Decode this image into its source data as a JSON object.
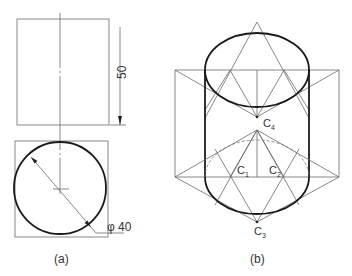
{
  "figures": [
    {
      "id": "a",
      "caption": "(a)",
      "dimensions": {
        "height_label": "50",
        "diameter_label": "φ 40"
      }
    },
    {
      "id": "b",
      "caption": "(b)",
      "points": {
        "c1": "C",
        "c1_sub": "1",
        "c2": "C",
        "c2_sub": "2",
        "c3": "C",
        "c3_sub": "3",
        "c4": "C",
        "c4_sub": "4"
      }
    }
  ],
  "colors": {
    "outline": "#1a1a1a",
    "construction": "#6a6a6a",
    "background": "#ffffff"
  }
}
